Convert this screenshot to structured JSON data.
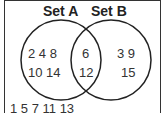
{
  "diagram": {
    "type": "venn",
    "sets": [
      {
        "label": "Set A",
        "only": [
          "2 4 8",
          "10 14"
        ]
      },
      {
        "label": "Set B",
        "only": [
          "3 9",
          "15"
        ]
      }
    ],
    "intersection": [
      "6",
      "12"
    ],
    "outside": "1 5 7 11 13"
  }
}
